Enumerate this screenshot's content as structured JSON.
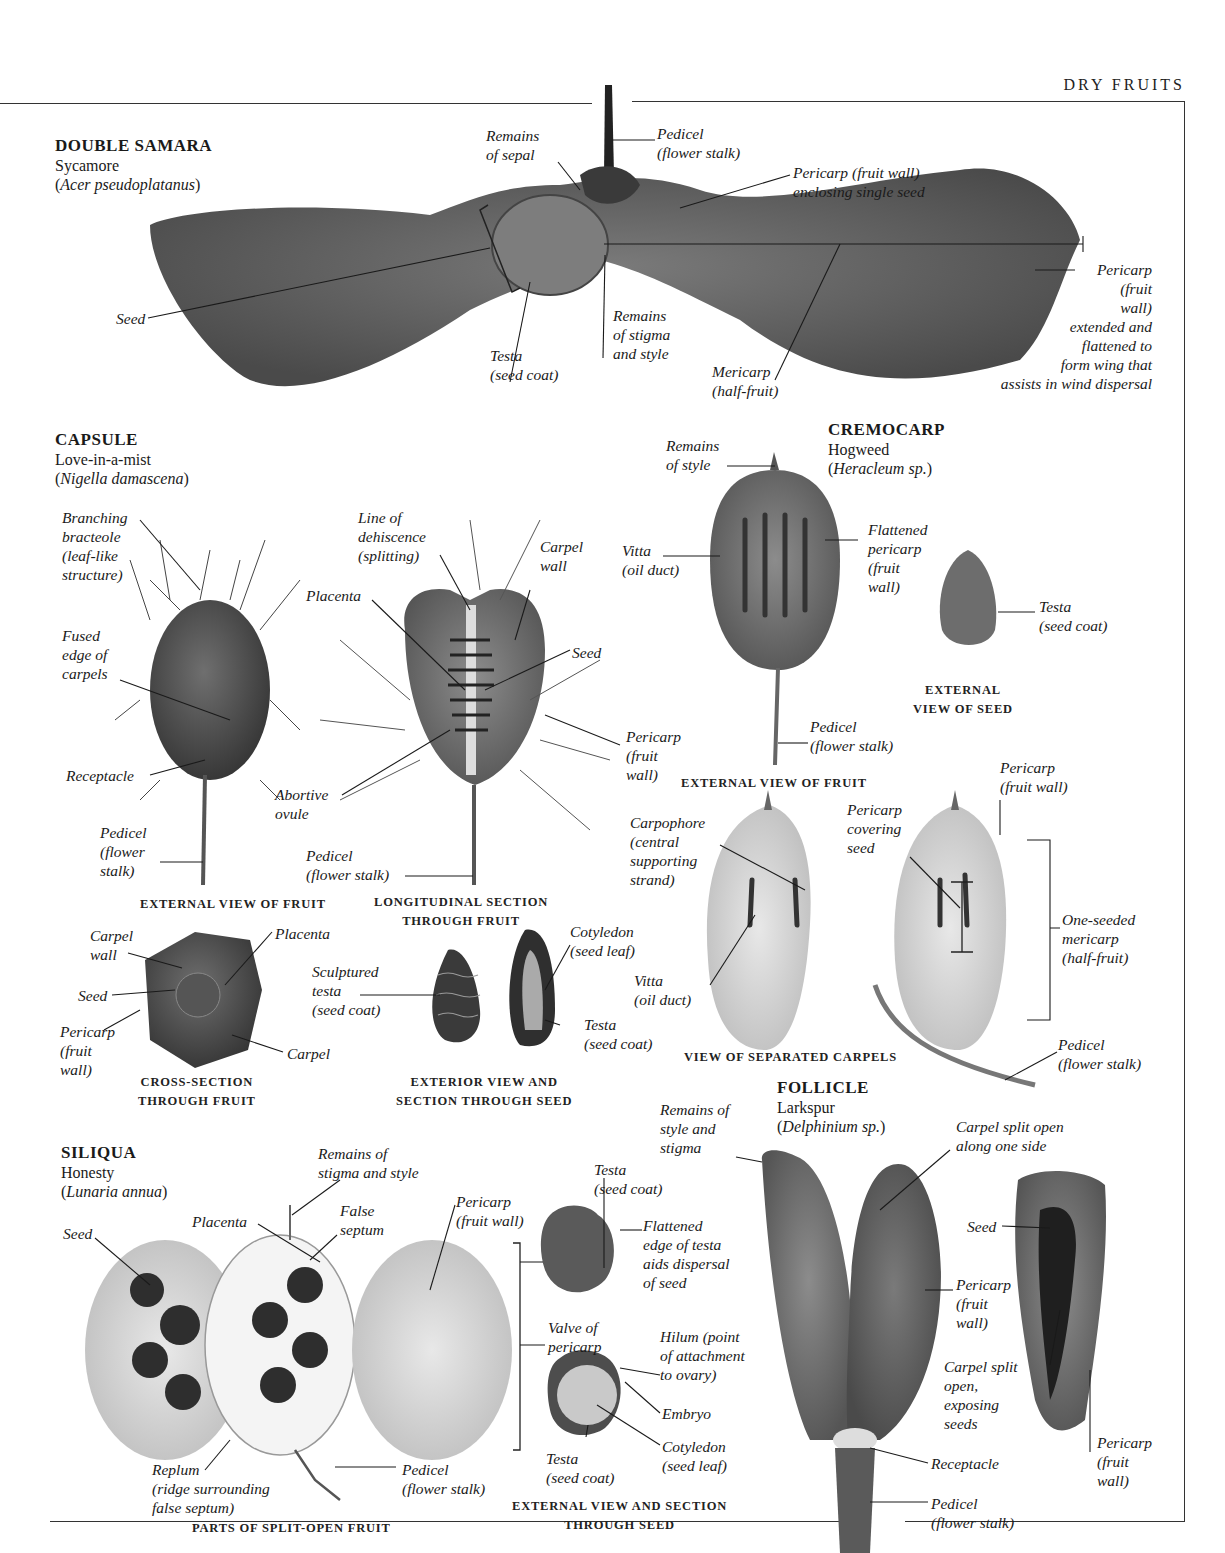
{
  "header": {
    "title": "DRY FRUITS"
  },
  "sections": {
    "double_samara": {
      "title": "DOUBLE SAMARA",
      "common": "Sycamore",
      "latin": "Acer pseudoplatanus",
      "labels": {
        "remains_sepal": "Remains\nof sepal",
        "pedicel": "Pedicel\n(flower stalk)",
        "pericarp_seed": "Pericarp (fruit wall)\nenclosing single seed",
        "seed": "Seed",
        "testa": "Testa\n(seed coat)",
        "remains_stigma": "Remains\nof stigma\nand style",
        "mericarp": "Mericarp\n(half-fruit)",
        "pericarp_wing": "Pericarp\n(fruit\nwall)\nextended and\nflattened to\nform wing that\nassists in wind dispersal"
      }
    },
    "capsule": {
      "title": "CAPSULE",
      "common": "Love-in-a-mist",
      "latin": "Nigella damascena",
      "labels": {
        "bracteole": "Branching\nbracteole\n(leaf-like\nstructure)",
        "fused_edge": "Fused\nedge of\ncarpels",
        "receptacle": "Receptacle",
        "pedicel_ext": "Pedicel\n(flower\nstalk)",
        "dehiscence": "Line of\ndehiscence\n(splitting)",
        "placenta": "Placenta",
        "carpel_wall": "Carpel\nwall",
        "seed": "Seed",
        "pericarp": "Pericarp\n(fruit\nwall)",
        "abortive": "Abortive\novule",
        "pedicel_long": "Pedicel\n(flower stalk)",
        "cs_carpel_wall": "Carpel\nwall",
        "cs_placenta": "Placenta",
        "cs_seed": "Seed",
        "cs_pericarp": "Pericarp\n(fruit\nwall)",
        "cs_carpel": "Carpel",
        "sculptured": "Sculptured\ntesta\n(seed coat)",
        "cotyledon": "Cotyledon\n(seed leaf)",
        "testa": "Testa\n(seed coat)"
      },
      "captions": {
        "external": "EXTERNAL VIEW OF FRUIT",
        "longitudinal": "LONGITUDINAL SECTION\nTHROUGH FRUIT",
        "cross": "CROSS-SECTION\nTHROUGH FRUIT",
        "seed": "EXTERIOR VIEW AND\nSECTION THROUGH SEED"
      }
    },
    "cremocarp": {
      "title": "CREMOCARP",
      "common": "Hogweed",
      "latin": "Heracleum sp.",
      "labels": {
        "remains_style": "Remains\nof style",
        "vitta": "Vitta\n(oil duct)",
        "flattened": "Flattened\npericarp\n(fruit\nwall)",
        "testa": "Testa\n(seed coat)",
        "pedicel": "Pedicel\n(flower stalk)",
        "carpophore": "Carpophore\n(central\nsupporting\nstrand)",
        "pericarp_cover": "Pericarp\ncovering\nseed",
        "pericarp_wall": "Pericarp\n(fruit wall)",
        "vitta2": "Vitta\n(oil duct)",
        "one_seeded": "One-seeded\nmericarp\n(half-fruit)",
        "pedicel2": "Pedicel\n(flower stalk)"
      },
      "captions": {
        "external_fruit": "EXTERNAL VIEW OF FRUIT",
        "external_seed": "EXTERNAL\nVIEW OF SEED",
        "separated": "VIEW OF SEPARATED CARPELS"
      }
    },
    "siliqua": {
      "title": "SILIQUA",
      "common": "Honesty",
      "latin": "Lunaria annua",
      "labels": {
        "seed": "Seed",
        "placenta": "Placenta",
        "remains": "Remains of\nstigma and style",
        "false_septum": "False\nseptum",
        "pericarp": "Pericarp\n(fruit wall)",
        "replum": "Replum\n(ridge surrounding\nfalse septum)",
        "pedicel": "Pedicel\n(flower stalk)",
        "testa_top": "Testa\n(seed coat)",
        "flattened": "Flattened\nedge of testa\naids dispersal\nof seed",
        "valve": "Valve of\npericarp",
        "hilum": "Hilum (point\nof attachment\nto ovary)",
        "embryo": "Embryo",
        "cotyledon": "Cotyledon\n(seed leaf)",
        "testa_bot": "Testa\n(seed coat)"
      },
      "captions": {
        "parts": "PARTS OF SPLIT-OPEN FRUIT",
        "seed": "EXTERNAL VIEW AND SECTION\nTHROUGH SEED"
      }
    },
    "follicle": {
      "title": "FOLLICLE",
      "common": "Larkspur",
      "latin": "Delphinium sp.",
      "labels": {
        "remains": "Remains of\nstyle and\nstigma",
        "split_side": "Carpel split open\nalong one side",
        "seed": "Seed",
        "pericarp": "Pericarp\n(fruit\nwall)",
        "split_open": "Carpel split\nopen,\nexposing\nseeds",
        "receptacle": "Receptacle",
        "pericarp2": "Pericarp\n(fruit\nwall)",
        "pedicel": "Pedicel\n(flower stalk)"
      }
    }
  }
}
